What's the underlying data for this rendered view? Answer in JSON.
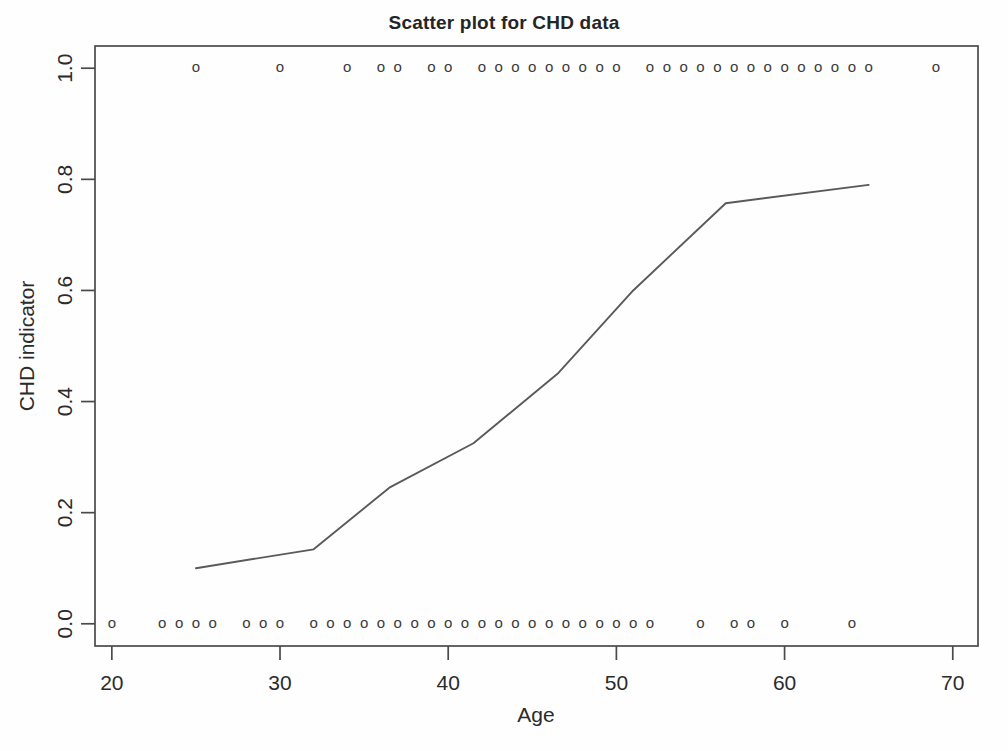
{
  "chart_data": {
    "type": "scatter",
    "title": "Scatter plot for CHD data",
    "xlabel": "Age",
    "ylabel": "CHD indicator",
    "xlim": [
      19,
      71.5
    ],
    "ylim": [
      -0.04,
      1.04
    ],
    "grid": false,
    "legend": null,
    "marker_glyph": "o",
    "xticks": [
      20,
      30,
      40,
      50,
      60,
      70
    ],
    "xtick_labels": [
      "20",
      "30",
      "40",
      "50",
      "60",
      "70"
    ],
    "yticks": [
      0.0,
      0.2,
      0.4,
      0.6,
      0.8,
      1.0
    ],
    "ytick_labels": [
      "0.0",
      "0.2",
      "0.4",
      "0.6",
      "0.8",
      "1.0"
    ],
    "series": [
      {
        "name": "CHD indicator = 1",
        "y_value": 1.0,
        "x": [
          25,
          30,
          34,
          36,
          37,
          39,
          40,
          42,
          43,
          44,
          45,
          46,
          47,
          48,
          49,
          50,
          52,
          53,
          54,
          55,
          56,
          57,
          58,
          59,
          60,
          61,
          62,
          63,
          64,
          65,
          69
        ],
        "count": 31
      },
      {
        "name": "CHD indicator = 0",
        "y_value": 0.0,
        "x": [
          20,
          23,
          24,
          25,
          26,
          28,
          29,
          30,
          32,
          33,
          34,
          35,
          36,
          37,
          38,
          39,
          40,
          41,
          42,
          43,
          44,
          45,
          46,
          47,
          48,
          49,
          50,
          51,
          52,
          55,
          57,
          58,
          60,
          64
        ],
        "count": 34
      }
    ],
    "fit_line": {
      "name": "lowess smooth",
      "x": [
        25,
        32,
        36.5,
        41.5,
        46.5,
        51,
        56.5,
        65
      ],
      "y": [
        0.1,
        0.134,
        0.245,
        0.325,
        0.45,
        0.6,
        0.757,
        0.79
      ]
    }
  }
}
